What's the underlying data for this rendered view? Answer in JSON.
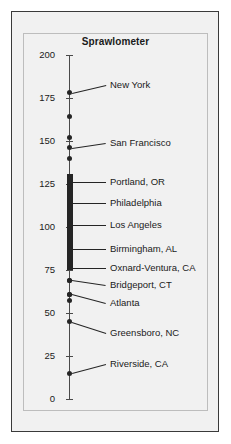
{
  "chart_data": {
    "type": "scatter",
    "title": "Sprawlometer",
    "xlabel": "",
    "ylabel": "",
    "ylim": [
      0,
      200
    ],
    "grid": false,
    "legend": null,
    "orientation": "vertical-strip-plot",
    "tick_labels": [
      "200",
      "175",
      "150",
      "125",
      "100",
      "75",
      "50",
      "25",
      "0"
    ],
    "ticks": [
      200,
      175,
      150,
      125,
      100,
      75,
      50,
      25,
      0
    ],
    "labeled_points": [
      {
        "label": "New York",
        "value": 178
      },
      {
        "label": "San Francisco",
        "value": 146
      },
      {
        "label": "Portland, OR",
        "value": 126
      },
      {
        "label": "Philadelphia",
        "value": 114
      },
      {
        "label": "Los Angeles",
        "value": 101
      },
      {
        "label": "Birmingham, AL",
        "value": 87
      },
      {
        "label": "Oxnard-Ventura, CA",
        "value": 76
      },
      {
        "label": "Bridgeport, CT",
        "value": 69
      },
      {
        "label": "Atlanta",
        "value": 61
      },
      {
        "label": "Greensboro, NC",
        "value": 45
      },
      {
        "label": "Riverside, CA",
        "value": 15
      }
    ],
    "unlabeled_points": [
      164,
      152,
      140,
      57
    ],
    "cluster": {
      "from": 75,
      "to": 131,
      "description": "dense overlapping points"
    }
  },
  "chart": {
    "title": "Sprawlometer",
    "axis": {
      "ticks": [
        {
          "label": "200",
          "value": 200
        },
        {
          "label": "175",
          "value": 175
        },
        {
          "label": "150",
          "value": 150
        },
        {
          "label": "125",
          "value": 125
        },
        {
          "label": "100",
          "value": 100
        },
        {
          "label": "75",
          "value": 75
        },
        {
          "label": "50",
          "value": 50
        },
        {
          "label": "25",
          "value": 25
        },
        {
          "label": "0",
          "value": 0
        }
      ]
    },
    "points": [
      {
        "label": "New York",
        "value": 178,
        "leader": "slanted"
      },
      {
        "label": "San Francisco",
        "value": 146,
        "leader": "slanted"
      },
      {
        "label": "Portland, OR",
        "value": 126,
        "leader": "flat"
      },
      {
        "label": "Philadelphia",
        "value": 114,
        "leader": "flat"
      },
      {
        "label": "Los Angeles",
        "value": 101,
        "leader": "flat"
      },
      {
        "label": "Birmingham, AL",
        "value": 87,
        "leader": "flat"
      },
      {
        "label": "Oxnard-Ventura, CA",
        "value": 76,
        "leader": "flat"
      },
      {
        "label": "Bridgeport, CT",
        "value": 69,
        "leader": "slanted"
      },
      {
        "label": "Atlanta",
        "value": 61,
        "leader": "slanted"
      },
      {
        "label": "Greensboro, NC",
        "value": 45,
        "leader": "slanted"
      },
      {
        "label": "Riverside, CA",
        "value": 15,
        "leader": "slanted"
      }
    ],
    "colors": {
      "dot": "#252525",
      "axis": "#4a4a4a",
      "background": "#f1f1f1",
      "outer_border": "#3a3a3a",
      "inner_border": "#bdbdbd",
      "text": "#1a1a1a"
    }
  }
}
